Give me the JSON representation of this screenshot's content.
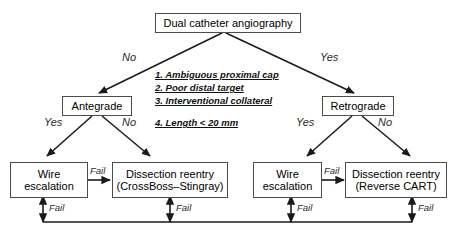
{
  "diagram": {
    "type": "clinical-decision-flowchart",
    "root": {
      "id": "dual-catheter-angiography",
      "label": "Dual catheter angiography"
    },
    "branch_labels": {
      "root_left": "No",
      "root_right": "Yes",
      "antegrade_left": "Yes",
      "antegrade_right": "No",
      "retrograde_left": "Yes",
      "retrograde_right": "No"
    },
    "criteria": {
      "heading": "",
      "items": [
        "1. Ambiguous proximal cap",
        "2. Poor distal target",
        "3. Interventional collateral",
        "4. Length < 20 mm"
      ]
    },
    "strategies": {
      "antegrade": "Antegrade",
      "retrograde": "Retrograde"
    },
    "techniques": [
      {
        "id": "antegrade-wire-escalation",
        "line1": "Wire",
        "line2": "escalation"
      },
      {
        "id": "antegrade-dissection-reentry",
        "line1": "Dissection reentry",
        "line2": "(CrossBoss–Stingray)"
      },
      {
        "id": "retrograde-wire-escalation",
        "line1": "Wire",
        "line2": "escalation"
      },
      {
        "id": "retrograde-dissection-reentry",
        "line1": "Dissection reentry",
        "line2": "(Reverse CART)"
      }
    ],
    "fail_labels": {
      "antegrade_cross": "Fail",
      "retrograde_cross": "Fail",
      "feedback_1": "Fail",
      "feedback_2": "Fail",
      "feedback_3": "Fail",
      "feedback_4": "Fail"
    },
    "colors": {
      "box_border": "#4c4c4c",
      "line": "#1a1a1a",
      "text": "#000000",
      "label_text": "#2b2b2b",
      "background": "#ffffff"
    }
  }
}
